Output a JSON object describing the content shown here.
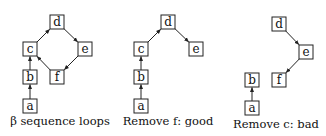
{
  "panels": [
    {
      "caption": "β sequence loops",
      "caption_pos": [
        60,
        125
      ],
      "nodes": [
        {
          "id": "d",
          "label": "d",
          "x": 57,
          "y": 22
        },
        {
          "id": "c",
          "label": "c",
          "x": 30,
          "y": 49
        },
        {
          "id": "e",
          "label": "e",
          "x": 85,
          "y": 49
        },
        {
          "id": "b",
          "label": "b",
          "x": 30,
          "y": 77
        },
        {
          "id": "f",
          "label": "f",
          "x": 57,
          "y": 77
        },
        {
          "id": "a",
          "label": "a",
          "x": 30,
          "y": 106
        }
      ],
      "edges": [
        [
          "a",
          "b"
        ],
        [
          "b",
          "c"
        ],
        [
          "c",
          "d"
        ],
        [
          "d",
          "e"
        ],
        [
          "e",
          "f"
        ],
        [
          "f",
          "c"
        ]
      ]
    },
    {
      "caption": "Remove f:  good",
      "caption_pos": [
        168,
        125
      ],
      "nodes": [
        {
          "id": "d",
          "label": "d",
          "x": 168,
          "y": 22
        },
        {
          "id": "c",
          "label": "c",
          "x": 141,
          "y": 49
        },
        {
          "id": "e",
          "label": "e",
          "x": 196,
          "y": 49
        },
        {
          "id": "b",
          "label": "b",
          "x": 141,
          "y": 77
        },
        {
          "id": "a",
          "label": "a",
          "x": 141,
          "y": 106
        }
      ],
      "edges": [
        [
          "a",
          "b"
        ],
        [
          "b",
          "c"
        ],
        [
          "c",
          "d"
        ],
        [
          "d",
          "e"
        ]
      ]
    },
    {
      "caption": "Remove c:  bad",
      "caption_pos": [
        276,
        128
      ],
      "nodes": [
        {
          "id": "d",
          "label": "d",
          "x": 279,
          "y": 24
        },
        {
          "id": "e",
          "label": "e",
          "x": 306,
          "y": 52
        },
        {
          "id": "f",
          "label": "f",
          "x": 279,
          "y": 80
        },
        {
          "id": "b",
          "label": "b",
          "x": 252,
          "y": 80
        },
        {
          "id": "a",
          "label": "a",
          "x": 252,
          "y": 108
        }
      ],
      "edges": [
        [
          "a",
          "b"
        ],
        [
          "d",
          "e"
        ],
        [
          "e",
          "f"
        ]
      ]
    }
  ]
}
